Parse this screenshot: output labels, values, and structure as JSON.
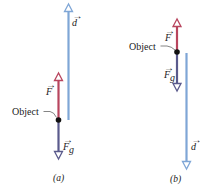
{
  "colors": {
    "displacement": "#7fa6d6",
    "applied_force": "#b8455e",
    "gravity_force": "#5a5a8c",
    "object": "#111111",
    "text": "#222222"
  },
  "labels": {
    "object": "Object",
    "force": "F",
    "gravity_force": "F",
    "gravity_subscript": "g",
    "displacement": "d",
    "arrow_accent": "→"
  },
  "panels": [
    {
      "id": "a",
      "caption": "(a)",
      "description": "Object moves upward; displacement d points up, applied force F up, gravitational force Fg down"
    },
    {
      "id": "b",
      "caption": "(b)",
      "description": "Object moves downward; displacement d points down, applied force F up, gravitational force Fg down"
    }
  ]
}
